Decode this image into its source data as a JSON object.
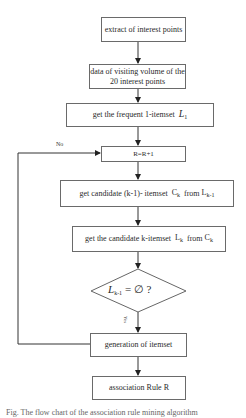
{
  "diagram": {
    "type": "flowchart",
    "nodes": [
      {
        "id": "extract",
        "label": "extract of interest points",
        "shape": "rect"
      },
      {
        "id": "visit",
        "label": "data of visiting volume of the 20 interest points",
        "shape": "rect"
      },
      {
        "id": "l1",
        "label": "get the frequent 1-itemset",
        "math": "L",
        "math_sub": "1",
        "shape": "rect"
      },
      {
        "id": "rinc",
        "label": "R=R+1",
        "shape": "rect"
      },
      {
        "id": "cand",
        "label_pre": "get candidate (k-1)- itemset",
        "c": "C",
        "c_sub": "k",
        "from": "from",
        "l": "L",
        "l_sub": "k-1",
        "shape": "rect"
      },
      {
        "id": "kset",
        "label_pre": "get the candidate k-itemset",
        "l": "L",
        "l_sub": "k",
        "from": "from",
        "c": "C",
        "c_sub": "k",
        "shape": "rect"
      },
      {
        "id": "cond",
        "math": "L",
        "math_sub": "k-1",
        "rest": " = ∅ ?",
        "shape": "diamond"
      },
      {
        "id": "gen",
        "label": "generation of itemset",
        "shape": "rect"
      },
      {
        "id": "rule",
        "label": "association Rule R",
        "shape": "rect"
      }
    ],
    "edges": [
      {
        "from": "extract",
        "to": "visit"
      },
      {
        "from": "visit",
        "to": "l1"
      },
      {
        "from": "l1",
        "to": "rinc"
      },
      {
        "from": "rinc",
        "to": "cand"
      },
      {
        "from": "cand",
        "to": "kset"
      },
      {
        "from": "kset",
        "to": "cond"
      },
      {
        "from": "cond",
        "to": "gen",
        "label": "Yes"
      },
      {
        "from": "gen",
        "to": "rinc",
        "label": "No"
      },
      {
        "from": "gen",
        "to": "rule"
      }
    ],
    "labels": {
      "no": "No",
      "yes": "Yes"
    },
    "caption": "Fig. The flow chart of the association rule mining algorithm"
  }
}
